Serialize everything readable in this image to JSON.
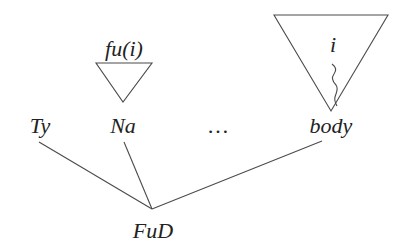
{
  "diagram": {
    "type": "tree",
    "root": {
      "label": "FuD"
    },
    "children": [
      {
        "label": "Ty"
      },
      {
        "label": "Na",
        "subtree_label": "fu(i)"
      },
      {
        "label": "…"
      },
      {
        "label": "body",
        "subtree_label": "i",
        "has_squiggle_link": true
      }
    ],
    "colors": {
      "stroke": "#4a4a4a",
      "text": "#222222",
      "background": "#ffffff"
    }
  }
}
